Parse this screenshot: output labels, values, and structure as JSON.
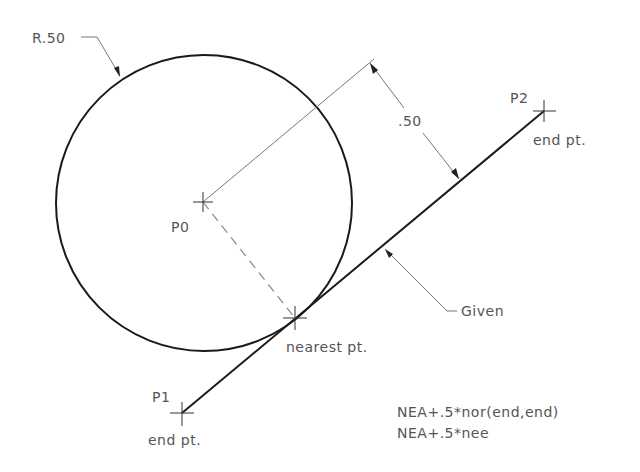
{
  "drawing": {
    "circle": {
      "label": "R.50",
      "cx": 204,
      "cy": 203,
      "r": 148
    },
    "points": {
      "p0": {
        "label": "P0",
        "x": 203,
        "y": 202
      },
      "p1": {
        "label": "P1",
        "sublabel": "end pt.",
        "x": 182,
        "y": 413
      },
      "p2": {
        "label": "P2",
        "sublabel": "end pt.",
        "x": 544,
        "y": 111
      },
      "nearest": {
        "label": "nearest pt.",
        "x": 295,
        "y": 318
      }
    },
    "dimension": {
      "label": ".50"
    },
    "given_line": {
      "label": "Given"
    },
    "formulas": [
      "NEA+.5*nor(end,end)",
      "NEA+.5*nee"
    ],
    "colors": {
      "geometry": "#1a1a1a",
      "annotation": "#777777",
      "text": "#555555",
      "background": "#ffffff"
    }
  }
}
